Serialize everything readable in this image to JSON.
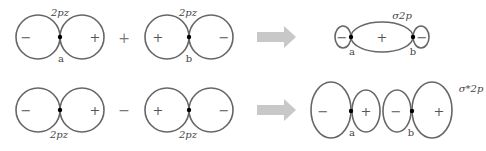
{
  "diagram": {
    "colors": {
      "stroke": "#666666",
      "node": "#000000",
      "arrow": "#c8c8c8",
      "text": "#444444"
    },
    "rows": [
      {
        "id": "bonding",
        "left_orbital": {
          "label": "2pz",
          "lobes": [
            "−",
            "+"
          ],
          "atom": "a"
        },
        "operator": "+",
        "right_orbital": {
          "label": "2pz",
          "lobes": [
            "+",
            "−"
          ],
          "atom": "b"
        },
        "arrow": "right-arrow",
        "result": {
          "label": "σ2p",
          "lobes": [
            "−",
            "+",
            "−"
          ],
          "atoms": [
            "a",
            "b"
          ]
        }
      },
      {
        "id": "antibonding",
        "left_orbital": {
          "label": "2pz",
          "lobes": [
            "−",
            "+"
          ]
        },
        "operator": "−",
        "right_orbital": {
          "label": "2pz",
          "lobes": [
            "+",
            "−"
          ]
        },
        "arrow": "right-arrow",
        "result": {
          "label": "σ*2p",
          "lobes": [
            "−",
            "+",
            "−",
            "+"
          ],
          "atoms": [
            "a",
            "b"
          ]
        }
      }
    ]
  }
}
